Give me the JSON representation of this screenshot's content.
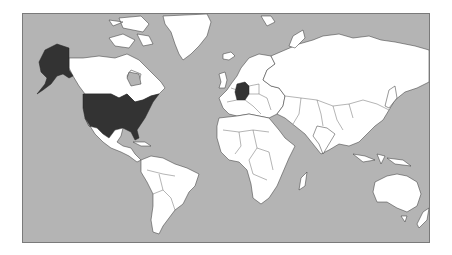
{
  "map": {
    "type": "choropleth world map",
    "projection": "Mercator",
    "colors": {
      "ocean": "#b4b4b4",
      "land_default": "#ffffff",
      "land_highlighted": "#333333",
      "border": "#333333",
      "frame": "#7a7a7a"
    },
    "highlighted_countries": [
      "United States of America",
      "Germany"
    ],
    "label": "Highlighted countries"
  }
}
